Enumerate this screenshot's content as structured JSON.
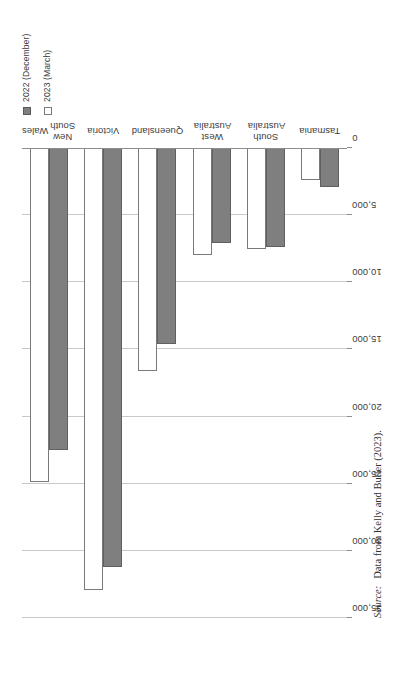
{
  "figure": {
    "orientation": "rotated-90-ccw",
    "source_note": {
      "keyword": "Source:",
      "text": "Data from Kelly and Butler (2023)."
    }
  },
  "legend": {
    "position": "top-left",
    "entries": [
      {
        "label": "2022 (December)",
        "swatch": "filled-square",
        "color": "#7f7f7f"
      },
      {
        "label": "2023 (March)",
        "swatch": "hollow-square",
        "color": "#ffffff"
      }
    ]
  },
  "chart_data": {
    "type": "bar",
    "orientation": "horizontal",
    "title": "",
    "xlabel": "",
    "ylabel": "",
    "grid": true,
    "legend_position": "top-left",
    "categories": [
      "New South Wales",
      "Victoria",
      "Queensland",
      "West Australia",
      "South Australia",
      "Tasmania"
    ],
    "category_lines": [
      [
        "New South",
        "Wales"
      ],
      [
        "Victoria"
      ],
      [
        "Queensland"
      ],
      [
        "West Australia"
      ],
      [
        "South Australia"
      ],
      [
        "Tasmania"
      ]
    ],
    "series": [
      {
        "name": "2022 (December)",
        "color": "#7f7f7f",
        "values": [
          22500,
          31200,
          14600,
          7100,
          7400,
          2900
        ]
      },
      {
        "name": "2023 (March)",
        "color": "#ffffff",
        "values": [
          24900,
          32900,
          16600,
          8000,
          7500,
          2400
        ]
      }
    ],
    "value_axis": {
      "min": 0,
      "max": 35000,
      "step": 5000,
      "ticks": [
        0,
        5000,
        10000,
        15000,
        20000,
        25000,
        30000,
        35000
      ],
      "tick_labels": [
        "0",
        "5,000",
        "10,000",
        "15,000",
        "20,000",
        "25,000",
        "30,000",
        "35,000"
      ]
    }
  }
}
